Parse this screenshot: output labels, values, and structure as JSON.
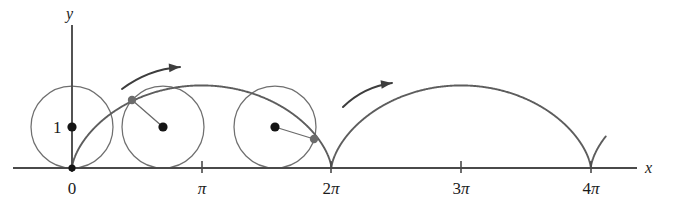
{
  "figure": {
    "background_color": "#ffffff",
    "width": 675,
    "height": 205
  },
  "axes": {
    "x_axis_label": "x",
    "y_axis_label": "y",
    "axis_color": "#4a4a4a",
    "x_axis_y_pixel": 168,
    "origin_x_pixel": 72,
    "pi_pixel_span": 129.7,
    "ticks": [
      {
        "label": "0",
        "value": 0,
        "x_pixel": 72,
        "has_tick_mark": false
      },
      {
        "label": "π",
        "value": 3.14159,
        "x_pixel": 202,
        "has_tick_mark": true
      },
      {
        "label": "2π",
        "value": 6.28319,
        "x_pixel": 331,
        "has_tick_mark": true
      },
      {
        "label": "3π",
        "value": 9.42478,
        "x_pixel": 461,
        "has_tick_mark": true
      },
      {
        "label": "4π",
        "value": 12.56637,
        "x_pixel": 591,
        "has_tick_mark": true
      }
    ]
  },
  "radius_label": "1",
  "circles": [
    {
      "name": "circle-at-origin",
      "center_x_pixel": 72,
      "center_y_pixel": 127,
      "radius_pixel": 41,
      "has_center_dot": true,
      "has_radius_line": false,
      "tracing_point_x_pixel": 72,
      "tracing_point_y_pixel": 168
    },
    {
      "name": "circle-rolled-quarter",
      "center_x_pixel": 163,
      "center_y_pixel": 127,
      "radius_pixel": 41,
      "has_center_dot": true,
      "has_radius_line": true,
      "tracing_point_x_pixel": 132,
      "tracing_point_y_pixel": 100
    },
    {
      "name": "circle-rolled-three-quarter",
      "center_x_pixel": 275,
      "center_y_pixel": 127,
      "radius_pixel": 41,
      "has_center_dot": true,
      "has_radius_line": true,
      "tracing_point_x_pixel": 314,
      "tracing_point_y_pixel": 139
    }
  ],
  "cycloid": {
    "color": "#5d5d5d",
    "radius_pixel": 41,
    "arch_peak_height_pixel": 82,
    "t_start": 0,
    "t_end": 13.9,
    "description": "x = r(t - sin t), y = r(1 - cos t)"
  },
  "direction_arrows": [
    {
      "name": "rotation-arrow-left",
      "start_x_pixel": 122,
      "start_y_pixel": 89,
      "end_x_pixel": 180,
      "end_y_pixel": 67
    },
    {
      "name": "rotation-arrow-right",
      "start_x_pixel": 343,
      "start_y_pixel": 107,
      "end_x_pixel": 392,
      "end_y_pixel": 83
    }
  ],
  "chart_data": {
    "type": "line",
    "xlabel": "x",
    "ylabel": "y",
    "xlim": [
      -0.55,
      13.9
    ],
    "ylim": [
      0,
      2.4
    ],
    "xtick_labels": [
      "0",
      "π",
      "2π",
      "3π",
      "4π"
    ],
    "xtick_values": [
      0,
      3.14159,
      6.28319,
      9.42478,
      12.56637
    ],
    "ytick_labels": [
      "1"
    ],
    "ytick_values": [
      1
    ],
    "grid": false,
    "legend": null,
    "series": [
      {
        "name": "cycloid",
        "parametric": true,
        "equation_x": "t - sin(t)",
        "equation_y": "1 - cos(t)",
        "t_range": [
          0,
          13.9
        ],
        "cusp_x_values": [
          0,
          6.28319,
          12.56637
        ],
        "peak_x_values": [
          3.14159,
          9.42478
        ],
        "peak_y_value": 2
      }
    ],
    "annotations": [
      {
        "text": "1",
        "type": "radius-label",
        "x": -0.35,
        "y": 1
      },
      {
        "type": "rolling-circle",
        "center_x": 0,
        "center_y": 1,
        "radius": 1
      },
      {
        "type": "rolling-circle",
        "center_x": 0.7,
        "center_y": 1,
        "radius": 1
      },
      {
        "type": "rolling-circle",
        "center_x": 1.57,
        "center_y": 1,
        "radius": 1
      },
      {
        "type": "direction-arrow",
        "description": "counterclockwise-to-right rolling direction"
      },
      {
        "type": "direction-arrow",
        "description": "counterclockwise-to-right rolling direction"
      }
    ]
  }
}
